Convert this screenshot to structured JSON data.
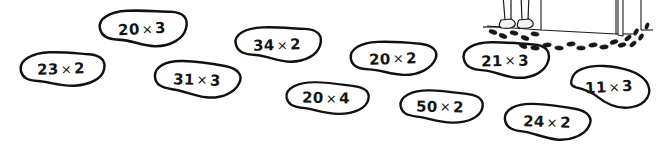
{
  "page": {
    "background_color": "#ffffff",
    "ink_color": "#111111",
    "width": 661,
    "height": 147
  },
  "blobs": [
    {
      "id": "blob-23x2",
      "a": "23",
      "op": "×",
      "b": "2",
      "label": "23 × 2",
      "x": 12,
      "y": 47,
      "w": 98,
      "h": 44,
      "rot": -2,
      "variant": 1
    },
    {
      "id": "blob-20x3",
      "a": "20",
      "op": "×",
      "b": "3",
      "label": "20 × 3",
      "x": 92,
      "y": 6,
      "w": 100,
      "h": 46,
      "rot": -3,
      "variant": 2
    },
    {
      "id": "blob-31x3",
      "a": "31",
      "op": "×",
      "b": "3",
      "label": "31 × 3",
      "x": 148,
      "y": 57,
      "w": 98,
      "h": 45,
      "rot": 2,
      "variant": 3
    },
    {
      "id": "blob-34x2",
      "a": "34",
      "op": "×",
      "b": "2",
      "label": "34 × 2",
      "x": 228,
      "y": 23,
      "w": 98,
      "h": 44,
      "rot": -2,
      "variant": 2
    },
    {
      "id": "blob-20x4",
      "a": "20",
      "op": "×",
      "b": "4",
      "label": "20 × 4",
      "x": 278,
      "y": 78,
      "w": 96,
      "h": 40,
      "rot": 1,
      "variant": 1
    },
    {
      "id": "blob-20x2",
      "a": "20",
      "op": "×",
      "b": "2",
      "label": "20 × 2",
      "x": 344,
      "y": 37,
      "w": 98,
      "h": 43,
      "rot": -2,
      "variant": 3
    },
    {
      "id": "blob-50x2",
      "a": "50",
      "op": "×",
      "b": "2",
      "label": "50 × 2",
      "x": 392,
      "y": 86,
      "w": 96,
      "h": 41,
      "rot": 1,
      "variant": 1
    },
    {
      "id": "blob-21x3",
      "a": "21",
      "op": "×",
      "b": "3",
      "label": "21 × 3",
      "x": 456,
      "y": 38,
      "w": 98,
      "h": 45,
      "rot": -1,
      "variant": 2
    },
    {
      "id": "blob-24x2",
      "a": "24",
      "op": "×",
      "b": "2",
      "label": "24 × 2",
      "x": 498,
      "y": 100,
      "w": 98,
      "h": 44,
      "rot": 2,
      "variant": 3
    },
    {
      "id": "blob-11x3",
      "a": "11",
      "op": "×",
      "b": "3",
      "label": "11 × 3",
      "x": 562,
      "y": 61,
      "w": 94,
      "h": 52,
      "rot": -3,
      "variant": 4
    }
  ],
  "illustration": {
    "name": "muddy-footprints-scene",
    "description": "Legs and shoes standing on a floor with a trail of muddy footprints leading to an open door",
    "parts": [
      {
        "name": "legs"
      },
      {
        "name": "shoes"
      },
      {
        "name": "floor-line"
      },
      {
        "name": "footprint-trail"
      },
      {
        "name": "wall"
      },
      {
        "name": "open-door"
      }
    ]
  }
}
